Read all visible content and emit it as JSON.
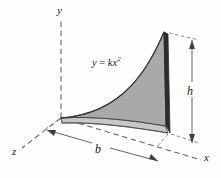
{
  "figure": {
    "name": "parabolic-spandrel-3d-diagram",
    "background_color": "#fefefe"
  },
  "axes": [
    {
      "id": "y",
      "label": "y",
      "style": "dashed",
      "direction": "up"
    },
    {
      "id": "z",
      "label": "z",
      "style": "dashed",
      "direction": "lower-left"
    },
    {
      "id": "x",
      "label": "x",
      "style": "dashed",
      "direction": "lower-right"
    }
  ],
  "curve": {
    "equation_lhs": "y",
    "equation_op": "=",
    "equation_rhs_coeff": "k",
    "equation_rhs_var": "x",
    "equation_rhs_exponent": "2",
    "equation_label": "y = kx²",
    "type": "parabola"
  },
  "dimensions": [
    {
      "id": "b",
      "label": "b",
      "orientation": "horizontal",
      "position": "base",
      "arrowheads": "both"
    },
    {
      "id": "h",
      "label": "h",
      "orientation": "vertical",
      "position": "right-edge",
      "arrowheads": "both"
    }
  ],
  "colors": {
    "face_fill": "#a9a9a9",
    "base_fill": "#c4c4c4",
    "edge_dark": "#2e2e32",
    "line": "#3a3a3f",
    "dashed_line": "#6a6a70",
    "text": "#15151a"
  }
}
